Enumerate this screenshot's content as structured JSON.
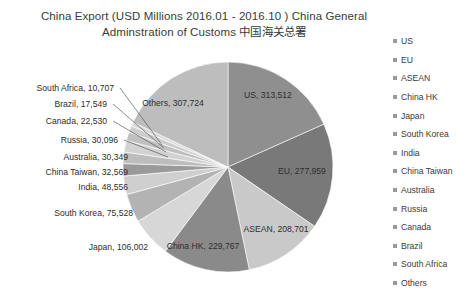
{
  "chart_data": {
    "type": "pie",
    "title": "China Export (USD Millions 2016.01 - 2016.10 ) China General Adminstration of Customs  中国海关总署",
    "title_line1": "China Export (USD Millions 2016.01 - 2016.10 ) China General Adminstration of",
    "title_line2": "Customs  中国海关总署",
    "unit": "USD Millions",
    "period": "2016.01 - 2016.10",
    "source": "China General Adminstration of Customs  中国海关总署",
    "categories": [
      "US",
      "EU",
      "ASEAN",
      "China HK",
      "Japan",
      "South Korea",
      "India",
      "China Taiwan",
      "Australia",
      "Russia",
      "Canada",
      "Brazil",
      "South Africa",
      "Others"
    ],
    "values": [
      313512,
      277959,
      208701,
      229767,
      106002,
      75528,
      48556,
      32569,
      30349,
      30096,
      22530,
      17549,
      10707,
      307724
    ],
    "labels": [
      {
        "name": "US",
        "value": 313512,
        "text": "US,  313,512",
        "placement": "inside"
      },
      {
        "name": "EU",
        "value": 277959,
        "text": "EU,  277,959",
        "placement": "inside"
      },
      {
        "name": "ASEAN",
        "value": 208701,
        "text": "ASEAN,  208,701",
        "placement": "inside"
      },
      {
        "name": "China HK",
        "value": 229767,
        "text": "China HK,  229,767",
        "placement": "inside"
      },
      {
        "name": "Japan",
        "value": 106002,
        "text": "Japan,  106,002",
        "placement": "outside"
      },
      {
        "name": "South Korea",
        "value": 75528,
        "text": "South Korea,  75,528",
        "placement": "outside"
      },
      {
        "name": "India",
        "value": 48556,
        "text": "India,  48,556",
        "placement": "outside"
      },
      {
        "name": "China Taiwan",
        "value": 32569,
        "text": "China Taiwan,  32,569",
        "placement": "outside"
      },
      {
        "name": "Australia",
        "value": 30349,
        "text": "Australia,  30,349",
        "placement": "outside"
      },
      {
        "name": "Russia",
        "value": 30096,
        "text": "Russia,  30,096",
        "placement": "outside-leader"
      },
      {
        "name": "Canada",
        "value": 22530,
        "text": "Canada,  22,530",
        "placement": "outside-leader"
      },
      {
        "name": "Brazil",
        "value": 17549,
        "text": "Brazil,  17,549",
        "placement": "outside-leader"
      },
      {
        "name": "South Africa",
        "value": 10707,
        "text": "South Africa,  10,707",
        "placement": "outside-leader"
      },
      {
        "name": "Others",
        "value": 307724,
        "text": "Others,  307,724",
        "placement": "inside"
      }
    ],
    "colors": [
      "#8f8f8f",
      "#797979",
      "#c9c9c9",
      "#8a8a8a",
      "#d7d7d7",
      "#b3b3b3",
      "#cfcfcf",
      "#9a9a9a",
      "#bdbdbd",
      "#d2d2d2",
      "#c0c0c0",
      "#cdcdcd",
      "#dadada",
      "#bdbdbd"
    ],
    "legend_position": "right",
    "legend_entries": [
      "US",
      "EU",
      "ASEAN",
      "China HK",
      "Japan",
      "South Korea",
      "India",
      "China Taiwan",
      "Australia",
      "Russia",
      "Canada",
      "Brazil",
      "South Africa",
      "Others"
    ],
    "grid": false,
    "start_angle_deg": -90,
    "direction": "clockwise"
  },
  "legend": {
    "swatch_color": "#9a9a9a"
  }
}
